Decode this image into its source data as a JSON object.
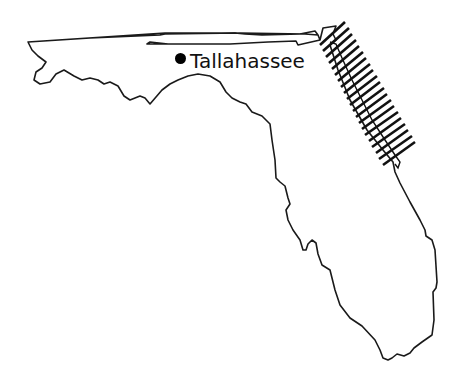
{
  "map": {
    "region": "Florida",
    "cities": [
      {
        "name": "Tallahassee",
        "marker": "filled-dot"
      }
    ],
    "highlighted_area": {
      "description": "hatched band along northeast Atlantic coast",
      "style": "diagonal-hatch"
    },
    "colors": {
      "outline": "#1a1a1a",
      "hatch": "#111111",
      "background": "#ffffff"
    }
  }
}
